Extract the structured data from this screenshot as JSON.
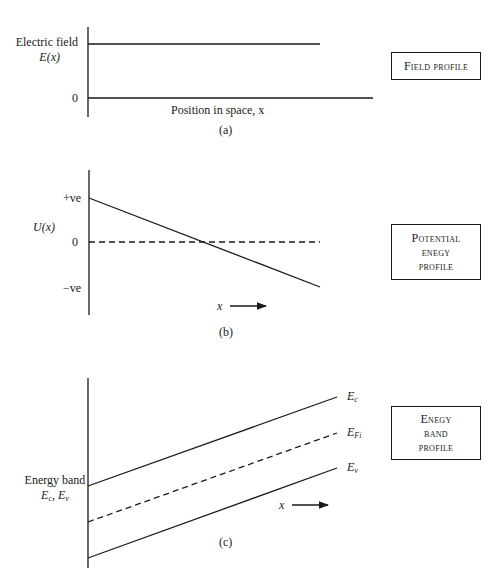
{
  "panels": [
    {
      "id": "a",
      "caption": "(a)",
      "y_label_line1": "Electric field",
      "y_label_line2": "E(x)",
      "zero_label": "0",
      "x_label": "Position in space, x",
      "box_lines": [
        "Field profile"
      ]
    },
    {
      "id": "b",
      "caption": "(b)",
      "y_label": "U(x)",
      "tick_pos": "+ve",
      "tick_zero": "0",
      "tick_neg": "−ve",
      "x_arrow_label": "x",
      "box_lines": [
        "Potential",
        "enegy",
        "profile"
      ]
    },
    {
      "id": "c",
      "caption": "(c)",
      "y_label_line1": "Energy band",
      "y_label_line2_a": "E",
      "y_label_line2_a_sub": "c",
      "y_label_line2_sep": ", ",
      "y_label_line2_b": "E",
      "y_label_line2_b_sub": "v",
      "x_arrow_label": "x",
      "curve_labels": {
        "ec": "E",
        "ec_sub": "c",
        "efi": "E",
        "efi_sub": "Fi",
        "ev": "E",
        "ev_sub": "v"
      },
      "box_lines": [
        "Enegy",
        "band",
        "profile"
      ]
    }
  ],
  "colors": {
    "ink": "#1a1a1a",
    "background": "#ffffff"
  }
}
